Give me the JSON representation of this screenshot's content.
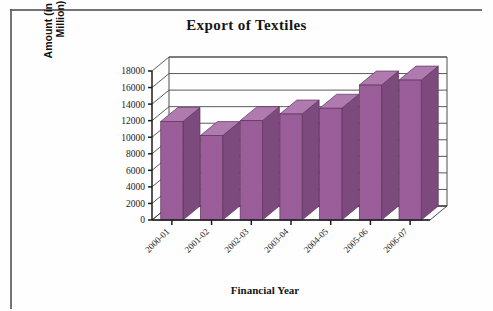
{
  "figure": {
    "kind": "scanned-bar-chart-figure",
    "background_color": "#ffffff",
    "border_color": "#5c5c5c"
  },
  "chart_data": {
    "type": "bar",
    "title": "Export of Textiles",
    "xlabel": "Financial Year",
    "ylabel_line1": "Amount (in US$",
    "ylabel_line2": "Million)",
    "ylabel": "Amount (in US$ Million)",
    "categories": [
      "2000-01",
      "2001-02",
      "2002-03",
      "2003-04",
      "2004-05",
      "2005-06",
      "2006-07"
    ],
    "values": [
      11900,
      10200,
      12000,
      12800,
      13500,
      16300,
      16900
    ],
    "ylim": [
      0,
      18000
    ],
    "yticks": [
      0,
      2000,
      4000,
      6000,
      8000,
      10000,
      12000,
      14000,
      16000,
      18000
    ],
    "ytick_labels": [
      "0",
      "2000",
      "4000",
      "6000",
      "8000",
      "10000",
      "12000",
      "14000",
      "16000",
      "18000"
    ],
    "grid": true,
    "legend": null,
    "legend_position": "none",
    "three_d": true,
    "bar_color": "#9b5e9b",
    "bar_top_color": "#b07cb0",
    "bar_side_color": "#7d4a7d",
    "category_label_rotation": -45
  }
}
